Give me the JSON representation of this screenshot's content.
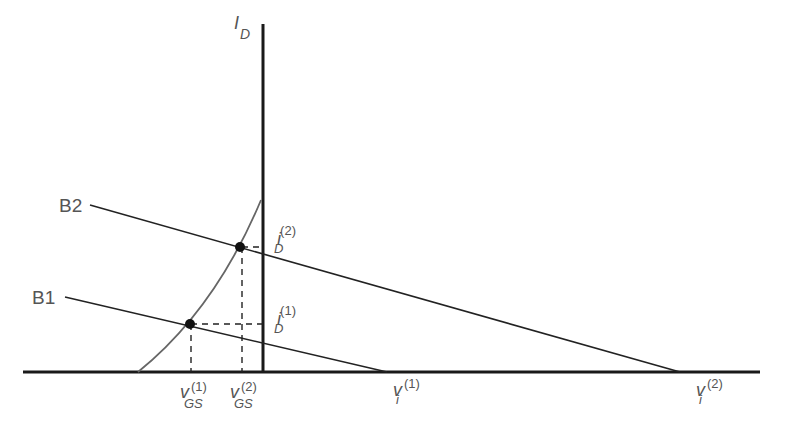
{
  "diagram": {
    "axis_y_label": {
      "main": "I",
      "sub": "D"
    },
    "bias_lines": [
      {
        "label": "B1",
        "x0": 65,
        "y0": 297,
        "x1": 387,
        "y1": 372
      },
      {
        "label": "B2",
        "x0": 90,
        "y0": 205,
        "x1": 680,
        "y1": 372
      }
    ],
    "operating_points": [
      {
        "name": "Q1",
        "cx": 190,
        "cy": 324
      },
      {
        "name": "Q2",
        "cx": 240,
        "cy": 247
      }
    ],
    "labels": {
      "id1": {
        "main": "i",
        "sub": "D",
        "sup": "(1)"
      },
      "id2": {
        "main": "i",
        "sub": "D",
        "sup": "(2)"
      },
      "vgs1": {
        "main": "v",
        "sub": "GS",
        "sup": "(1)"
      },
      "vgs2": {
        "main": "v",
        "sub": "GS",
        "sup": "(2)"
      },
      "vi1": {
        "main": "v",
        "sub": "i",
        "sup": "(1)"
      },
      "vi2": {
        "main": "v",
        "sub": "i",
        "sup": "(2)"
      }
    },
    "colors": {
      "axis": "#1a1a1a",
      "line": "#222222",
      "curve": "#666666",
      "text": "#555555"
    }
  }
}
